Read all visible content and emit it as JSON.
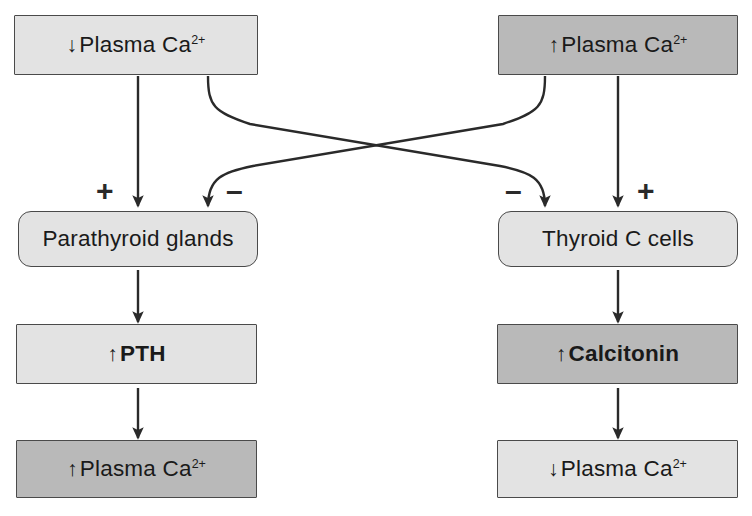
{
  "diagram": {
    "colors": {
      "fill_light": "#e3e3e3",
      "fill_dark": "#b9b9b9",
      "stroke": "#4a4a4a",
      "text": "#1a1a1a",
      "background": "#ffffff"
    },
    "nodes": [
      {
        "id": "low-plasma-ca-top",
        "arrow": "↓",
        "text": "Plasma Ca",
        "superscript": "2+",
        "shape": "rectangle",
        "fill": "light",
        "bold": false
      },
      {
        "id": "high-plasma-ca-top",
        "arrow": "↑",
        "text": "Plasma Ca",
        "superscript": "2+",
        "shape": "rectangle",
        "fill": "dark",
        "bold": false
      },
      {
        "id": "parathyroid-glands",
        "arrow": "",
        "text": "Parathyroid glands",
        "superscript": "",
        "shape": "rounded",
        "fill": "light",
        "bold": false
      },
      {
        "id": "thyroid-c-cells",
        "arrow": "",
        "text": "Thyroid C cells",
        "superscript": "",
        "shape": "rounded",
        "fill": "light",
        "bold": false
      },
      {
        "id": "pth",
        "arrow": "↑",
        "text": "PTH",
        "superscript": "",
        "shape": "rectangle",
        "fill": "light",
        "bold": true
      },
      {
        "id": "calcitonin",
        "arrow": "↑",
        "text": "Calcitonin",
        "superscript": "",
        "shape": "rectangle",
        "fill": "dark",
        "bold": true
      },
      {
        "id": "high-plasma-ca-bottom",
        "arrow": "↑",
        "text": "Plasma Ca",
        "superscript": "2+",
        "shape": "rectangle",
        "fill": "dark",
        "bold": false
      },
      {
        "id": "low-plasma-ca-bottom",
        "arrow": "↓",
        "text": "Plasma Ca",
        "superscript": "2+",
        "shape": "rectangle",
        "fill": "light",
        "bold": false
      }
    ],
    "signs": [
      {
        "id": "sign-stimulate-parathyroid",
        "symbol": "+",
        "meaning": "stimulates"
      },
      {
        "id": "sign-inhibit-parathyroid",
        "symbol": "–",
        "meaning": "inhibits"
      },
      {
        "id": "sign-inhibit-thyroid-c",
        "symbol": "–",
        "meaning": "inhibits"
      },
      {
        "id": "sign-stimulate-thyroid-c",
        "symbol": "+",
        "meaning": "stimulates"
      }
    ],
    "edges": [
      {
        "id": "edge-low-ca-to-parathyroid",
        "from": "low-plasma-ca-top",
        "to": "parathyroid-glands",
        "style": "straight",
        "sign": "+"
      },
      {
        "id": "edge-high-ca-to-parathyroid",
        "from": "high-plasma-ca-top",
        "to": "parathyroid-glands",
        "style": "crossing",
        "sign": "–"
      },
      {
        "id": "edge-low-ca-to-thyroid-c",
        "from": "low-plasma-ca-top",
        "to": "thyroid-c-cells",
        "style": "crossing",
        "sign": "–"
      },
      {
        "id": "edge-high-ca-to-thyroid-c",
        "from": "high-plasma-ca-top",
        "to": "thyroid-c-cells",
        "style": "straight",
        "sign": "+"
      },
      {
        "id": "edge-parathyroid-to-pth",
        "from": "parathyroid-glands",
        "to": "pth",
        "style": "straight",
        "sign": ""
      },
      {
        "id": "edge-pth-to-high-ca",
        "from": "pth",
        "to": "high-plasma-ca-bottom",
        "style": "straight",
        "sign": ""
      },
      {
        "id": "edge-thyroid-c-to-calcitonin",
        "from": "thyroid-c-cells",
        "to": "calcitonin",
        "style": "straight",
        "sign": ""
      },
      {
        "id": "edge-calcitonin-to-low-ca",
        "from": "calcitonin",
        "to": "low-plasma-ca-bottom",
        "style": "straight",
        "sign": ""
      }
    ]
  }
}
